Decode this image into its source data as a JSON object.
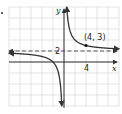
{
  "chart_data": {
    "type": "line",
    "title": "",
    "function": "y = 4/x + 2",
    "xlabel": "x",
    "ylabel": "y",
    "xlim": [
      -10,
      10
    ],
    "ylim": [
      -8,
      10
    ],
    "grid": true,
    "grid_step": 2,
    "tick_labels": {
      "x": [
        "4"
      ],
      "y": [
        "2"
      ]
    },
    "asymptotes": {
      "vertical": 0,
      "horizontal": 2
    },
    "annotations": [
      {
        "label": "(4, 3)",
        "x": 4,
        "y": 3
      }
    ],
    "series": [
      {
        "name": "left branch",
        "x": [
          -10,
          -8,
          -6,
          -4,
          -2,
          -1,
          -0.5
        ],
        "y": [
          1.6,
          1.5,
          1.33,
          1,
          0,
          -2,
          -6
        ]
      },
      {
        "name": "right branch",
        "x": [
          0.45,
          0.5,
          1,
          2,
          4,
          6,
          8,
          10
        ],
        "y": [
          10.9,
          10,
          6,
          4,
          3,
          2.67,
          2.5,
          2.4
        ]
      }
    ],
    "colors": {
      "curve": "#333333",
      "grid": "#d8d8d8",
      "axis": "#333333",
      "asymptote": "#555555"
    }
  },
  "labels": {
    "x_axis": "x",
    "y_axis": "y",
    "x_tick": "4",
    "y_tick": "2",
    "point": "(4, 3)"
  }
}
